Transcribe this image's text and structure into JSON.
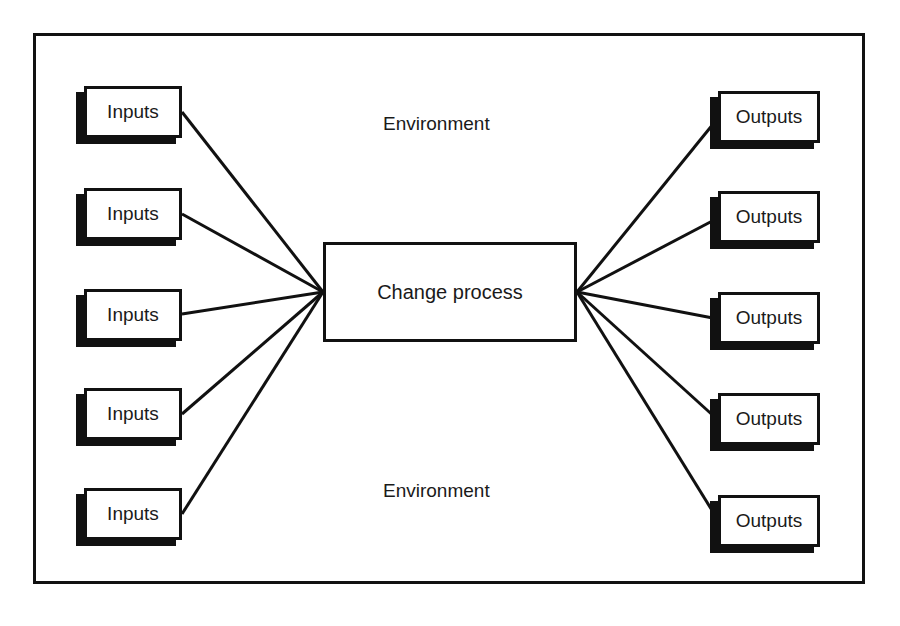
{
  "diagram": {
    "center": {
      "label": "Change process"
    },
    "environment_labels": [
      "Environment",
      "Environment"
    ],
    "inputs": [
      {
        "label": "Inputs",
        "x": 84,
        "y": 86
      },
      {
        "label": "Inputs",
        "x": 84,
        "y": 188
      },
      {
        "label": "Inputs",
        "x": 84,
        "y": 289
      },
      {
        "label": "Inputs",
        "x": 84,
        "y": 388
      },
      {
        "label": "Inputs",
        "x": 84,
        "y": 488
      }
    ],
    "outputs": [
      {
        "label": "Outputs",
        "x": 718,
        "y": 91
      },
      {
        "label": "Outputs",
        "x": 718,
        "y": 191
      },
      {
        "label": "Outputs",
        "x": 718,
        "y": 292
      },
      {
        "label": "Outputs",
        "x": 718,
        "y": 393
      },
      {
        "label": "Outputs",
        "x": 718,
        "y": 495
      }
    ],
    "colors": {
      "line": "#111111",
      "background": "#ffffff"
    }
  }
}
